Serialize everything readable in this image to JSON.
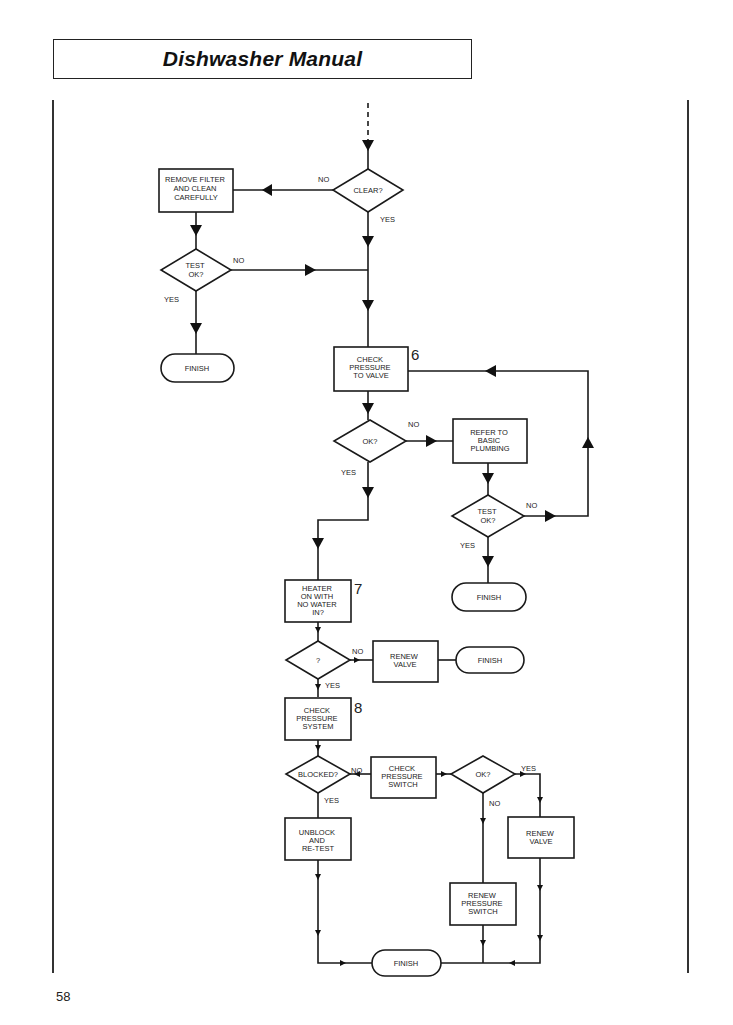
{
  "header": {
    "title": "Dishwasher Manual"
  },
  "page": {
    "number": "58"
  },
  "flowchart": {
    "step_numbers": {
      "s6": "6",
      "s7": "7",
      "s8": "8"
    },
    "nodes": {
      "clear": [
        "CLEAR?"
      ],
      "remove_filter": [
        "REMOVE FILTER",
        "AND CLEAN",
        "CAREFULLY"
      ],
      "test_ok_1": [
        "TEST",
        "OK?"
      ],
      "finish_1": [
        "FINISH"
      ],
      "check_pressure_valve": [
        "CHECK",
        "PRESSURE",
        "TO VALVE"
      ],
      "ok_1": [
        "OK?"
      ],
      "refer_plumbing": [
        "REFER TO",
        "BASIC",
        "PLUMBING"
      ],
      "test_ok_2": [
        "TEST",
        "OK?"
      ],
      "finish_2": [
        "FINISH"
      ],
      "heater": [
        "HEATER",
        "ON WITH",
        "NO WATER",
        "IN?"
      ],
      "question": [
        "?"
      ],
      "renew_valve_1": [
        "RENEW",
        "VALVE"
      ],
      "finish_3": [
        "FINISH"
      ],
      "check_pressure_system": [
        "CHECK",
        "PRESSURE",
        "SYSTEM"
      ],
      "blocked": [
        "BLOCKED?"
      ],
      "check_pressure_switch": [
        "CHECK",
        "PRESSURE",
        "SWITCH"
      ],
      "ok_2": [
        "OK?"
      ],
      "renew_valve_2": [
        "RENEW",
        "VALVE"
      ],
      "unblock": [
        "UNBLOCK",
        "AND",
        "RE-TEST"
      ],
      "renew_pressure_switch": [
        "RENEW",
        "PRESSURE",
        "SWITCH"
      ],
      "finish_4": [
        "FINISH"
      ]
    },
    "edge_labels": {
      "clear_no": "NO",
      "clear_yes": "YES",
      "test1_no": "NO",
      "test1_yes": "YES",
      "ok1_no": "NO",
      "ok1_yes": "YES",
      "test2_no": "NO",
      "test2_yes": "YES",
      "question_no": "NO",
      "question_yes": "YES",
      "blocked_no": "NO",
      "blocked_yes": "YES",
      "ok2_yes": "YES",
      "ok2_no": "NO"
    }
  }
}
